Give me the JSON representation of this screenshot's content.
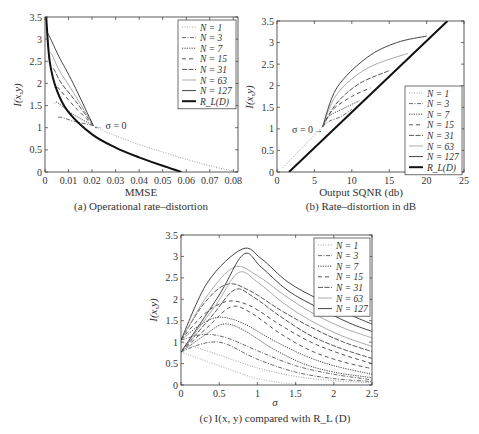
{
  "chart_data": [
    {
      "id": "a",
      "type": "line",
      "title": "(a) Operational rate–distortion",
      "xlabel": "MMSE",
      "ylabel": "I(x,y)",
      "xlim": [
        0,
        0.082
      ],
      "ylim": [
        0,
        3.5
      ],
      "xticks": [
        "0",
        "0.01",
        "0.02",
        "0.03",
        "0.04",
        "0.05",
        "0.06",
        "0.07",
        "0.08"
      ],
      "yticks": [
        "0",
        "0.5",
        "1",
        "1.5",
        "2",
        "2.5",
        "3",
        "3.5"
      ],
      "grid": false,
      "legend_position": "upper right",
      "annotation": "← σ = 0",
      "annotation_xy": [
        0.021,
        1.05
      ],
      "series": [
        {
          "name": "N = 1",
          "style": "dotted",
          "x": [
            0.0205,
            0.025,
            0.03,
            0.04,
            0.05,
            0.06,
            0.07,
            0.082
          ],
          "y": [
            1.05,
            0.93,
            0.82,
            0.62,
            0.45,
            0.29,
            0.14,
            0.0
          ]
        },
        {
          "name": "N = 3",
          "style": "dashdot",
          "x": [
            0.0205,
            0.012,
            0.008,
            0.006,
            0.005
          ],
          "y": [
            1.05,
            1.15,
            1.22,
            1.24,
            1.22
          ]
        },
        {
          "name": "N = 7",
          "style": "dotted-dense",
          "x": [
            0.0205,
            0.012,
            0.007,
            0.005,
            0.004
          ],
          "y": [
            1.05,
            1.3,
            1.5,
            1.58,
            1.55
          ]
        },
        {
          "name": "N = 15",
          "style": "dashed",
          "x": [
            0.0205,
            0.013,
            0.008,
            0.005,
            0.004
          ],
          "y": [
            1.05,
            1.45,
            1.75,
            1.93,
            1.9
          ]
        },
        {
          "name": "N = 31",
          "style": "dashdash",
          "x": [
            0.0205,
            0.013,
            0.007,
            0.004,
            0.003
          ],
          "y": [
            1.05,
            1.6,
            2.0,
            2.3,
            2.35
          ]
        },
        {
          "name": "N = 63",
          "style": "solid-light",
          "x": [
            0.0205,
            0.012,
            0.006,
            0.003,
            0.002
          ],
          "y": [
            1.05,
            1.8,
            2.3,
            2.65,
            2.7
          ]
        },
        {
          "name": "N = 127",
          "style": "solid",
          "x": [
            0.0205,
            0.012,
            0.006,
            0.002,
            0.001
          ],
          "y": [
            1.05,
            2.0,
            2.6,
            3.05,
            3.15
          ]
        },
        {
          "name": "R_L(D)",
          "style": "solid-bold",
          "x": [
            0.0005,
            0.002,
            0.005,
            0.01,
            0.02,
            0.03,
            0.04,
            0.05,
            0.058
          ],
          "y": [
            3.5,
            2.5,
            1.85,
            1.35,
            0.85,
            0.55,
            0.33,
            0.14,
            0.0
          ]
        }
      ]
    },
    {
      "id": "b",
      "type": "line",
      "title": "(b) Rate–distortion in dB",
      "xlabel": "Output SQNR (db)",
      "ylabel": "I(x,y)",
      "xlim": [
        0,
        25
      ],
      "ylim": [
        0,
        3.5
      ],
      "xticks": [
        "0",
        "5",
        "10",
        "15",
        "20",
        "25"
      ],
      "yticks": [
        "0",
        "0.5",
        "1",
        "1.5",
        "2",
        "2.5",
        "3",
        "3.5"
      ],
      "grid": false,
      "legend_position": "lower right",
      "annotation": "σ = 0→",
      "annotation_xy": [
        6.0,
        1.05
      ],
      "series": [
        {
          "name": "N = 1",
          "style": "dotted",
          "x": [
            0.8,
            3,
            6.1
          ],
          "y": [
            0.1,
            0.5,
            1.05
          ]
        },
        {
          "name": "N = 3",
          "style": "dashdot",
          "x": [
            6.1,
            7,
            8.5,
            10
          ],
          "y": [
            1.05,
            1.18,
            1.28,
            1.45
          ]
        },
        {
          "name": "N = 7",
          "style": "dotted-dense",
          "x": [
            6.1,
            7,
            9,
            11
          ],
          "y": [
            1.05,
            1.3,
            1.48,
            1.65
          ]
        },
        {
          "name": "N = 15",
          "style": "dashed",
          "x": [
            6.1,
            7.5,
            10,
            12.5
          ],
          "y": [
            1.05,
            1.45,
            1.75,
            1.95
          ]
        },
        {
          "name": "N = 31",
          "style": "dashdash",
          "x": [
            6.1,
            8,
            11,
            15
          ],
          "y": [
            1.05,
            1.6,
            2.05,
            2.35
          ]
        },
        {
          "name": "N = 63",
          "style": "solid-light",
          "x": [
            6.1,
            8,
            12,
            17.5
          ],
          "y": [
            1.05,
            1.8,
            2.4,
            2.75
          ]
        },
        {
          "name": "N = 127",
          "style": "solid",
          "x": [
            6.1,
            8,
            12,
            16,
            20
          ],
          "y": [
            1.05,
            1.95,
            2.65,
            3.0,
            3.15
          ]
        },
        {
          "name": "R_L(D)",
          "style": "solid-bold",
          "x": [
            1.6,
            22.8
          ],
          "y": [
            0.0,
            3.5
          ]
        }
      ]
    },
    {
      "id": "c",
      "type": "line",
      "title": "(c) I(x, y) compared with R_L (D)",
      "xlabel": "σ",
      "ylabel": "I(x,y)",
      "xlim": [
        0,
        2.5
      ],
      "ylim": [
        0,
        3.5
      ],
      "xticks": [
        "0",
        "0.5",
        "1",
        "1.5",
        "2",
        "2.5"
      ],
      "yticks": [
        "0",
        "0.5",
        "1",
        "1.5",
        "2",
        "2.5",
        "3",
        "3.5"
      ],
      "grid": false,
      "legend_position": "upper right",
      "note": "Each N has two curves: I(x,y) (starting at 0.77) and R_L(D) (starting at ~1.05)",
      "series": [
        {
          "name": "N = 1 (I)",
          "style": "dotted-light",
          "x": [
            0,
            0.5,
            1,
            1.5,
            2,
            2.5
          ],
          "y": [
            0.77,
            0.45,
            0.15,
            0.02,
            0,
            0
          ]
        },
        {
          "name": "N = 1 (R_L)",
          "style": "dotted",
          "x": [
            0,
            0.5,
            1,
            1.5,
            2,
            2.5
          ],
          "y": [
            1.0,
            0.7,
            0.4,
            0.2,
            0.1,
            0.05
          ]
        },
        {
          "name": "N = 3 (I)",
          "style": "dashdot",
          "x": [
            0,
            0.2,
            0.4,
            0.6,
            1,
            1.5,
            2,
            2.5
          ],
          "y": [
            0.77,
            0.92,
            1.0,
            0.95,
            0.6,
            0.3,
            0.15,
            0.08
          ]
        },
        {
          "name": "N = 3 (R_L)",
          "style": "dashdot",
          "x": [
            0,
            0.3,
            0.6,
            1,
            1.5,
            2,
            2.5
          ],
          "y": [
            1.05,
            1.18,
            1.1,
            0.8,
            0.45,
            0.25,
            0.12
          ]
        },
        {
          "name": "N = 7 (I)",
          "style": "dotted-dense",
          "x": [
            0,
            0.3,
            0.55,
            0.8,
            1.2,
            1.6,
            2,
            2.5
          ],
          "y": [
            0.77,
            1.15,
            1.42,
            1.3,
            0.85,
            0.5,
            0.3,
            0.17
          ]
        },
        {
          "name": "N = 7 (R_L)",
          "style": "dotted-dense",
          "x": [
            0,
            0.25,
            0.5,
            0.8,
            1.2,
            1.6,
            2,
            2.5
          ],
          "y": [
            1.05,
            1.4,
            1.58,
            1.45,
            1.05,
            0.7,
            0.45,
            0.25
          ]
        },
        {
          "name": "N = 15 (I)",
          "style": "dashed",
          "x": [
            0,
            0.35,
            0.65,
            0.9,
            1.3,
            1.7,
            2.1,
            2.5
          ],
          "y": [
            0.77,
            1.35,
            1.82,
            1.7,
            1.2,
            0.8,
            0.55,
            0.38
          ]
        },
        {
          "name": "N = 15 (R_L)",
          "style": "dashed",
          "x": [
            0,
            0.3,
            0.6,
            0.9,
            1.3,
            1.7,
            2.1,
            2.5
          ],
          "y": [
            1.05,
            1.65,
            1.95,
            1.85,
            1.4,
            1.0,
            0.72,
            0.5
          ]
        },
        {
          "name": "N = 31 (I)",
          "style": "dashdash",
          "x": [
            0,
            0.4,
            0.7,
            0.95,
            1.3,
            1.7,
            2.1,
            2.5
          ],
          "y": [
            0.77,
            1.6,
            2.22,
            2.05,
            1.6,
            1.15,
            0.85,
            0.62
          ]
        },
        {
          "name": "N = 31 (R_L)",
          "style": "dashdash",
          "x": [
            0,
            0.3,
            0.6,
            0.9,
            1.3,
            1.7,
            2.1,
            2.5
          ],
          "y": [
            1.05,
            1.9,
            2.35,
            2.2,
            1.75,
            1.35,
            1.02,
            0.78
          ]
        },
        {
          "name": "N = 63 (I)",
          "style": "solid-light",
          "x": [
            0,
            0.45,
            0.75,
            1.0,
            1.35,
            1.7,
            2.1,
            2.5
          ],
          "y": [
            0.77,
            1.85,
            2.62,
            2.4,
            1.9,
            1.5,
            1.15,
            0.9
          ]
        },
        {
          "name": "N = 63 (R_L)",
          "style": "solid-light",
          "x": [
            0,
            0.35,
            0.7,
            1.0,
            1.35,
            1.7,
            2.1,
            2.5
          ],
          "y": [
            1.05,
            2.1,
            2.75,
            2.55,
            2.1,
            1.7,
            1.35,
            1.1
          ]
        },
        {
          "name": "N = 127 (I)",
          "style": "solid",
          "x": [
            0,
            0.5,
            0.82,
            1.05,
            1.4,
            1.8,
            2.2,
            2.5
          ],
          "y": [
            0.77,
            2.1,
            3.05,
            2.75,
            2.2,
            1.8,
            1.45,
            1.25
          ]
        },
        {
          "name": "N = 127 (R_L)",
          "style": "solid",
          "x": [
            0,
            0.35,
            0.8,
            1.05,
            1.4,
            1.8,
            2.2,
            2.5
          ],
          "y": [
            1.05,
            2.4,
            3.17,
            2.95,
            2.4,
            2.0,
            1.65,
            1.42
          ]
        }
      ]
    }
  ],
  "panels": {
    "a": {
      "caption": "(a) Operational rate–distortion",
      "xlabel": "MMSE",
      "ylabel": "I(x,y)",
      "annotation": "← σ = 0",
      "legend": [
        "N = 1",
        "N = 3",
        "N = 7",
        "N = 15",
        "N = 31",
        "N = 63",
        "N = 127",
        "R_L(D)"
      ]
    },
    "b": {
      "caption": "(b) Rate–distortion in dB",
      "xlabel": "Output SQNR (db)",
      "ylabel": "I(x,y)",
      "annotation": "σ = 0→",
      "legend": [
        "N = 1",
        "N = 3",
        "N = 7",
        "N = 15",
        "N = 31",
        "N = 63",
        "N = 127",
        "R_L(D)"
      ]
    },
    "c": {
      "caption": "(c) I(x, y) compared with R_L (D)",
      "xlabel": "σ",
      "ylabel": "I(x,y)",
      "legend": [
        "N = 1",
        "N = 3",
        "N = 7",
        "N = 15",
        "N = 31",
        "N = 63",
        "N = 127"
      ]
    }
  },
  "styles": {
    "dotted": {
      "color": "#888888",
      "dash": "1,1.5",
      "width": 0.8
    },
    "dotted-light": {
      "color": "#bbbbbb",
      "dash": "1,1.5",
      "width": 1.2
    },
    "dashdot": {
      "color": "#444444",
      "dash": "4,1.5,1,1.5",
      "width": 0.8
    },
    "dotted-dense": {
      "color": "#444444",
      "dash": "1.2,1.2",
      "width": 1.0
    },
    "dashed": {
      "color": "#444444",
      "dash": "4,3",
      "width": 0.9
    },
    "dashdash": {
      "color": "#444444",
      "dash": "5,1.5",
      "width": 0.9
    },
    "solid-light": {
      "color": "#aaaaaa",
      "dash": "",
      "width": 1.0
    },
    "solid": {
      "color": "#444444",
      "dash": "",
      "width": 1.0
    },
    "solid-bold": {
      "color": "#111111",
      "dash": "",
      "width": 2.0
    }
  },
  "legend_styles_ab": [
    "dotted",
    "dashdot",
    "dotted-dense",
    "dashed",
    "dashdash",
    "solid-light",
    "solid",
    "solid-bold"
  ],
  "legend_styles_c": [
    "dotted",
    "dashdot",
    "dotted-dense",
    "dashed",
    "dashdash",
    "solid-light",
    "solid"
  ]
}
